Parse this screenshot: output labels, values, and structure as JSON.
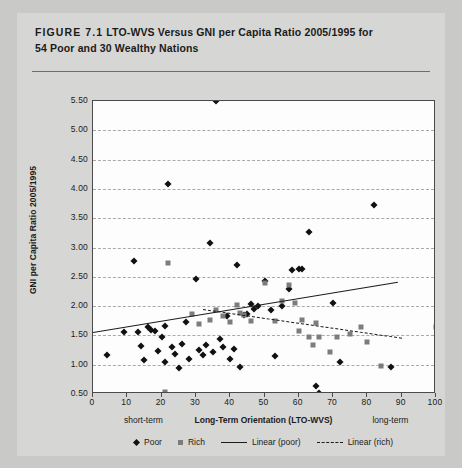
{
  "figure": {
    "label": "FIGURE 7.1",
    "caption_line1": "LTO-WVS Versus GNI per Capita Ratio 2005/1995 for",
    "caption_line2": "54 Poor and 30 Wealthy Nations"
  },
  "legend": {
    "position": "bottom",
    "items": [
      {
        "label": "Poor",
        "marker": "diamond",
        "color": "#111111"
      },
      {
        "label": "Rich",
        "marker": "square",
        "color": "#7c7c7c"
      },
      {
        "label": "Linear (poor)",
        "marker": "solid-line",
        "color": "#1b1b1b"
      },
      {
        "label": "Linear (rich)",
        "marker": "dashed-line",
        "color": "#1b1b1b"
      }
    ]
  },
  "axis_notes": {
    "left": "short-term",
    "right": "long-term"
  },
  "colors": {
    "page_background": "#c9c9c7",
    "card_background": "#d6d6d4",
    "plot_background": "#fdfdfd",
    "frame": "#4a4a4a",
    "grid": "#a9a9a9",
    "poor": "#111111",
    "rich": "#7c7c7c",
    "trend": "#1b1b1b"
  },
  "chart_data": {
    "type": "scatter",
    "title": "LTO-WVS Versus GNI per Capita Ratio 2005/1995 for 54 Poor and 30 Wealthy Nations",
    "xlabel": "Long-Term Orientation (LTO-WVS)",
    "ylabel": "GNI per Capita Ratio 2005/1995",
    "xlim": [
      0,
      100
    ],
    "ylim": [
      0.5,
      5.5
    ],
    "xticks": [
      0,
      10,
      20,
      30,
      40,
      50,
      60,
      70,
      80,
      90,
      100
    ],
    "yticks": [
      0.5,
      1.0,
      1.5,
      2.0,
      2.5,
      3.0,
      3.5,
      4.0,
      4.5,
      5.0,
      5.5
    ],
    "ytick_labels": [
      "0.50",
      "1.00",
      "1.50",
      "2.00",
      "2.50",
      "3.00",
      "3.50",
      "4.00",
      "4.50",
      "5.00",
      "5.50"
    ],
    "grid": "horizontal-dashed",
    "series": [
      {
        "name": "Poor",
        "marker": "diamond",
        "color": "#111111",
        "count": 54,
        "points": [
          [
            4,
            1.16
          ],
          [
            9,
            1.55
          ],
          [
            12,
            2.77
          ],
          [
            13,
            1.55
          ],
          [
            14,
            1.32
          ],
          [
            15,
            1.08
          ],
          [
            16,
            1.64
          ],
          [
            17,
            1.6
          ],
          [
            18,
            1.57
          ],
          [
            19,
            1.23
          ],
          [
            20,
            1.47
          ],
          [
            21,
            1.05
          ],
          [
            21,
            1.66
          ],
          [
            22,
            4.08
          ],
          [
            23,
            1.3
          ],
          [
            24,
            1.18
          ],
          [
            25,
            0.94
          ],
          [
            26,
            1.35
          ],
          [
            27,
            1.73
          ],
          [
            28,
            1.09
          ],
          [
            30,
            2.47
          ],
          [
            31,
            1.25
          ],
          [
            32,
            1.17
          ],
          [
            33,
            1.33
          ],
          [
            34,
            3.07
          ],
          [
            35,
            1.21
          ],
          [
            36,
            5.5
          ],
          [
            37,
            1.44
          ],
          [
            38,
            1.3
          ],
          [
            39,
            1.83
          ],
          [
            40,
            1.1
          ],
          [
            41,
            1.26
          ],
          [
            42,
            2.7
          ],
          [
            43,
            0.96
          ],
          [
            44,
            1.84
          ],
          [
            45,
            1.87
          ],
          [
            46,
            2.04
          ],
          [
            47,
            1.95
          ],
          [
            48,
            2.01
          ],
          [
            50,
            2.42
          ],
          [
            52,
            1.93
          ],
          [
            53,
            1.15
          ],
          [
            55,
            2.0
          ],
          [
            57,
            2.29
          ],
          [
            58,
            2.62
          ],
          [
            60,
            2.63
          ],
          [
            61,
            2.64
          ],
          [
            63,
            3.27
          ],
          [
            65,
            0.64
          ],
          [
            66,
            0.52
          ],
          [
            70,
            2.05
          ],
          [
            72,
            1.04
          ],
          [
            82,
            3.72
          ],
          [
            87,
            0.96
          ]
        ]
      },
      {
        "name": "Rich",
        "marker": "square",
        "color": "#7c7c7c",
        "count": 30,
        "points": [
          [
            21,
            0.53
          ],
          [
            22,
            2.73
          ],
          [
            29,
            1.86
          ],
          [
            31,
            1.7
          ],
          [
            34,
            1.77
          ],
          [
            36,
            1.94
          ],
          [
            38,
            1.83
          ],
          [
            40,
            1.73
          ],
          [
            42,
            2.02
          ],
          [
            43,
            1.89
          ],
          [
            44,
            1.85
          ],
          [
            46,
            1.74
          ],
          [
            50,
            2.4
          ],
          [
            53,
            1.74
          ],
          [
            55,
            2.08
          ],
          [
            57,
            2.36
          ],
          [
            59,
            2.05
          ],
          [
            60,
            1.57
          ],
          [
            61,
            1.76
          ],
          [
            63,
            1.48
          ],
          [
            64,
            1.34
          ],
          [
            65,
            1.72
          ],
          [
            66,
            1.48
          ],
          [
            69,
            1.22
          ],
          [
            71,
            1.47
          ],
          [
            75,
            1.52
          ],
          [
            78,
            1.64
          ],
          [
            80,
            1.39
          ],
          [
            84,
            0.97
          ],
          [
            100,
            1.65
          ]
        ]
      }
    ],
    "trendlines": [
      {
        "name": "Linear (poor)",
        "style": "solid",
        "color": "#1b1b1b",
        "x_start": 0,
        "y_start": 1.56,
        "x_end": 89,
        "y_end": 2.42
      },
      {
        "name": "Linear (rich)",
        "style": "dashed",
        "color": "#1b1b1b",
        "x_start": 32,
        "y_start": 1.95,
        "x_end": 90,
        "y_end": 1.46
      }
    ]
  }
}
